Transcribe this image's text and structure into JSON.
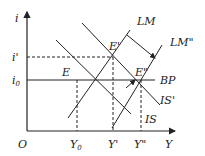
{
  "diagram": {
    "type": "IS-LM-BP",
    "axes": {
      "y_label": "i",
      "x_label": "Y",
      "origin_label": "O"
    },
    "y_levels": {
      "i_prime": "i'",
      "i_zero_main": "i",
      "i_zero_sub": "0"
    },
    "x_levels": {
      "y_zero_main": "Y",
      "y_zero_sub": "0",
      "y_prime": "Y'",
      "y_double_prime": "Y\""
    },
    "curves": {
      "lm": "LM",
      "lm_double_prime": "LM\"",
      "bp": "BP",
      "is": "IS",
      "is_prime": "IS'"
    },
    "points": {
      "e": "E",
      "e_prime": "E'",
      "e_double_prime": "E\""
    },
    "colors": {
      "line": "#222222",
      "background": "#ffffff"
    }
  }
}
